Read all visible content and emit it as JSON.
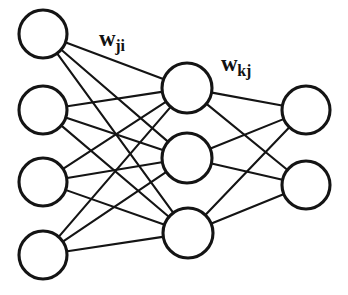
{
  "diagram": {
    "type": "neural-network",
    "background_color": "#ffffff",
    "stroke_color": "#141414",
    "node_fill_color": "#ffffff",
    "labels": [
      {
        "id": "w-ji",
        "base": "w",
        "subscript": "ji",
        "text": "wji",
        "meaning": "weights from input layer i to hidden layer j",
        "x": 99,
        "y": 27
      },
      {
        "id": "w-kj",
        "base": "w",
        "subscript": "kj",
        "text": "wkj",
        "meaning": "weights from hidden layer j to output layer k",
        "x": 221,
        "y": 52
      }
    ],
    "layers": [
      {
        "name": "input-layer",
        "index_symbol": "i",
        "node_count": 4,
        "radius": 24,
        "nodes": [
          {
            "id": "i1",
            "cx": 43,
            "cy": 34
          },
          {
            "id": "i2",
            "cx": 43,
            "cy": 110
          },
          {
            "id": "i3",
            "cx": 43,
            "cy": 182
          },
          {
            "id": "i4",
            "cx": 43,
            "cy": 255
          }
        ]
      },
      {
        "name": "hidden-layer",
        "index_symbol": "j",
        "node_count": 3,
        "radius": 25,
        "nodes": [
          {
            "id": "j1",
            "cx": 187,
            "cy": 88
          },
          {
            "id": "j2",
            "cx": 187,
            "cy": 158
          },
          {
            "id": "j3",
            "cx": 188,
            "cy": 233
          }
        ]
      },
      {
        "name": "output-layer",
        "index_symbol": "k",
        "node_count": 2,
        "radius": 24,
        "nodes": [
          {
            "id": "k1",
            "cx": 306,
            "cy": 110
          },
          {
            "id": "k2",
            "cx": 306,
            "cy": 185
          }
        ]
      }
    ],
    "connections": {
      "input_to_hidden": {
        "label_id": "w-ji",
        "fully_connected": true,
        "edge_count": 12,
        "edges": [
          {
            "from": "i1",
            "to": "j1"
          },
          {
            "from": "i1",
            "to": "j2"
          },
          {
            "from": "i1",
            "to": "j3"
          },
          {
            "from": "i2",
            "to": "j1"
          },
          {
            "from": "i2",
            "to": "j2"
          },
          {
            "from": "i2",
            "to": "j3"
          },
          {
            "from": "i3",
            "to": "j1"
          },
          {
            "from": "i3",
            "to": "j2"
          },
          {
            "from": "i3",
            "to": "j3"
          },
          {
            "from": "i4",
            "to": "j1"
          },
          {
            "from": "i4",
            "to": "j2"
          },
          {
            "from": "i4",
            "to": "j3"
          }
        ]
      },
      "hidden_to_output": {
        "label_id": "w-kj",
        "fully_connected": true,
        "edge_count": 6,
        "edges": [
          {
            "from": "j1",
            "to": "k1"
          },
          {
            "from": "j1",
            "to": "k2"
          },
          {
            "from": "j2",
            "to": "k1"
          },
          {
            "from": "j2",
            "to": "k2"
          },
          {
            "from": "j3",
            "to": "k1"
          },
          {
            "from": "j3",
            "to": "k2"
          }
        ]
      }
    }
  }
}
